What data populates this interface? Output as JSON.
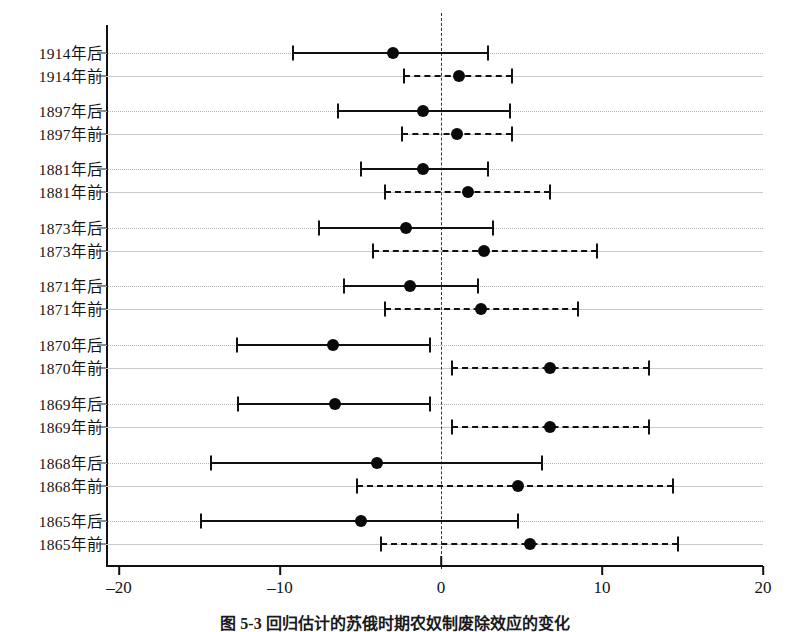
{
  "caption": "图 5-3  回归估计的苏俄时期农奴制废除效应的变化",
  "chart_data": {
    "type": "scatter",
    "title": "图 5-3  回归估计的苏俄时期农奴制废除效应的变化",
    "orientation": "horizontal",
    "xlabel": "",
    "ylabel": "",
    "xlim": [
      -20,
      20
    ],
    "xticks": [
      -20,
      -10,
      0,
      10,
      20
    ],
    "xticklabels": [
      "–20",
      "–10",
      "0",
      "10",
      "20"
    ],
    "grid": true,
    "legend": null,
    "reference_line": 0,
    "reference_line_style": "dashed",
    "categories": [
      "1914年后",
      "1914年前",
      "1897年后",
      "1897年前",
      "1881年后",
      "1881年前",
      "1873年后",
      "1873年前",
      "1871年后",
      "1871年前",
      "1870年后",
      "1870年前",
      "1869年后",
      "1869年前",
      "1868年后",
      "1868年前",
      "1865年后",
      "1865年前"
    ],
    "points": [
      {
        "label": "1914年后",
        "estimate": -3.0,
        "low": -9.2,
        "high": 2.9,
        "style": "solid"
      },
      {
        "label": "1914年前",
        "estimate": 1.1,
        "low": -2.3,
        "high": 4.4,
        "style": "dashed"
      },
      {
        "label": "1897年后",
        "estimate": -1.1,
        "low": -6.4,
        "high": 4.3,
        "style": "solid"
      },
      {
        "label": "1897年前",
        "estimate": 1.0,
        "low": -2.4,
        "high": 4.4,
        "style": "dashed"
      },
      {
        "label": "1881年后",
        "estimate": -1.1,
        "low": -5.0,
        "high": 2.9,
        "style": "solid"
      },
      {
        "label": "1881年前",
        "estimate": 1.7,
        "low": -3.5,
        "high": 6.8,
        "style": "dashed"
      },
      {
        "label": "1873年后",
        "estimate": -2.2,
        "low": -7.6,
        "high": 3.2,
        "style": "solid"
      },
      {
        "label": "1873年前",
        "estimate": 2.7,
        "low": -4.2,
        "high": 9.7,
        "style": "dashed"
      },
      {
        "label": "1871年后",
        "estimate": -1.9,
        "low": -6.0,
        "high": 2.3,
        "style": "solid"
      },
      {
        "label": "1871年前",
        "estimate": 2.5,
        "low": -3.5,
        "high": 8.5,
        "style": "dashed"
      },
      {
        "label": "1870年后",
        "estimate": -6.7,
        "low": -12.7,
        "high": -0.7,
        "style": "solid"
      },
      {
        "label": "1870年前",
        "estimate": 6.8,
        "low": 0.7,
        "high": 12.9,
        "style": "dashed"
      },
      {
        "label": "1869年后",
        "estimate": -6.6,
        "low": -12.6,
        "high": -0.7,
        "style": "solid"
      },
      {
        "label": "1869年前",
        "estimate": 6.8,
        "low": 0.7,
        "high": 12.9,
        "style": "dashed"
      },
      {
        "label": "1868年后",
        "estimate": -4.0,
        "low": -14.3,
        "high": 6.3,
        "style": "solid"
      },
      {
        "label": "1868年前",
        "estimate": 4.8,
        "low": -5.2,
        "high": 14.4,
        "style": "dashed"
      },
      {
        "label": "1865年后",
        "estimate": -5.0,
        "low": -14.9,
        "high": 4.8,
        "style": "solid"
      },
      {
        "label": "1865年前",
        "estimate": 5.5,
        "low": -3.7,
        "high": 14.7,
        "style": "dashed"
      }
    ]
  }
}
